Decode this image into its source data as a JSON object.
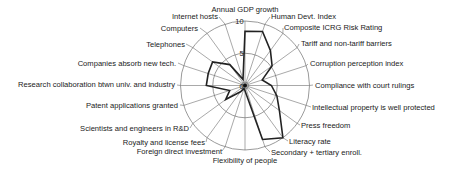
{
  "chart_data": {
    "type": "radar",
    "title": "",
    "range": [
      0,
      10
    ],
    "rings": [
      5,
      10
    ],
    "tick_labels": [
      "0",
      "5",
      "10"
    ],
    "grid": true,
    "legend": null,
    "axes": [
      "Annual GDP growth",
      "Human Devt. Index",
      "Composite ICRG Risk Rating",
      "Tariff and non-tariff barriers",
      "Corruption perception index",
      "Compliance with court rulings",
      "Intellectual property is well protected",
      "Press freedom",
      "Literacy rate",
      "Secondary + tertiary enroll.",
      "Flexibility of people",
      "Foreign direct investment",
      "Royalty and license fees",
      "Scientists and engineers in R&D",
      "Patent applications granted",
      "Research collaboration btwn univ. and industry",
      "Companies absorb new tech.",
      "Telephones",
      "Computers",
      "Internet hosts"
    ],
    "series": [
      {
        "name": "Country score",
        "values": [
          8.4,
          8.8,
          6.7,
          5.2,
          2.8,
          4.1,
          5.2,
          6.6,
          10.0,
          8.8,
          0.8,
          0.5,
          1.2,
          3.7,
          2.5,
          6.0,
          6.0,
          6.2,
          4.0,
          1.0
        ]
      }
    ]
  }
}
